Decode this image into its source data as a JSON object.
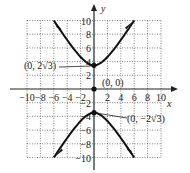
{
  "chart_data": {
    "type": "line",
    "title": "",
    "xlabel": "x",
    "ylabel": "y",
    "xlim": [
      -10,
      10
    ],
    "ylim": [
      -10,
      10
    ],
    "grid": true,
    "x_ticks": [
      "-10",
      "-8",
      "-6",
      "-4",
      "-2",
      "2",
      "4",
      "6",
      "8",
      "10"
    ],
    "y_ticks": [
      "10",
      "8",
      "6",
      "4",
      "2",
      "-2",
      "-4",
      "-6",
      "-8",
      "-10"
    ],
    "series": [
      {
        "name": "upper branch",
        "equation": "y^2/12 - x^2/12... hyperbola upper",
        "points": [
          [
            -6,
            10
          ],
          [
            -4,
            6.1
          ],
          [
            -2,
            4
          ],
          [
            0,
            3.46
          ],
          [
            2,
            4
          ],
          [
            4,
            6.1
          ],
          [
            6,
            10
          ]
        ]
      },
      {
        "name": "lower branch",
        "points": [
          [
            -6,
            -10
          ],
          [
            -4,
            -6.1
          ],
          [
            -2,
            -4
          ],
          [
            0,
            -3.46
          ],
          [
            2,
            -4
          ],
          [
            4,
            -6.1
          ],
          [
            6,
            -10
          ]
        ]
      }
    ],
    "annotations": [
      {
        "text": "(0, 2√3)",
        "point": [
          0,
          3.46
        ]
      },
      {
        "text": "(0, 0)",
        "point": [
          0,
          0
        ]
      },
      {
        "text": "(0, −2√3)",
        "point": [
          0,
          -3.46
        ]
      }
    ]
  },
  "labels": {
    "x_axis": "x",
    "y_axis": "y",
    "upper_vertex": "(0, 2√3)",
    "center": "(0, 0)",
    "lower_vertex": "(0, −2√3)"
  }
}
